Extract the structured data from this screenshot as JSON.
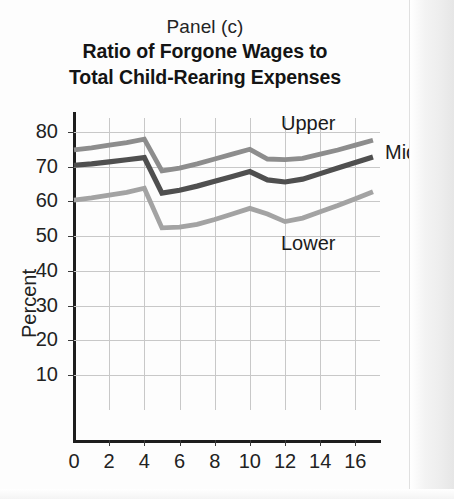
{
  "figure": {
    "panel_label": "Panel (c)",
    "title_line1": "Ratio of Forgone Wages to",
    "title_line2": "Total Child-Rearing Expenses"
  },
  "labels": {
    "upper": "Upper",
    "middle": "Middle",
    "lower": "Lower"
  },
  "colors": {
    "upper": "#8d8d8d",
    "middle": "#4f4f4f",
    "lower": "#a3a3a3",
    "grid": "#c8c8c8",
    "axis": "#1d1d1d",
    "background": "#fdfdfd"
  },
  "chart_data": {
    "type": "line",
    "title": "Ratio of Forgone Wages to Total Child-Rearing Expenses",
    "subtitle": "Panel (c)",
    "xlabel": "",
    "ylabel": "Percent",
    "xlim": [
      0,
      17.4
    ],
    "ylim": [
      0,
      84
    ],
    "xticks": [
      0,
      2,
      4,
      6,
      8,
      10,
      12,
      14,
      16
    ],
    "xtick_labels": [
      "0",
      "2",
      "4",
      "6",
      "8",
      "10",
      "12",
      "14",
      "16"
    ],
    "yticks": [
      10,
      20,
      30,
      40,
      50,
      60,
      70,
      80
    ],
    "ytick_labels": [
      "10",
      "20",
      "30",
      "40",
      "50",
      "60",
      "70",
      "80"
    ],
    "grid": true,
    "legend": "inline-annotations",
    "x": [
      0,
      1,
      2,
      3,
      4,
      5,
      6,
      7,
      8,
      9,
      10,
      11,
      12,
      13,
      14,
      15,
      16,
      17
    ],
    "series": [
      {
        "name": "Upper",
        "color": "#8d8d8d",
        "values": [
          74.8,
          75.4,
          76.2,
          76.9,
          77.9,
          68.8,
          69.6,
          70.8,
          72.2,
          73.6,
          75.0,
          72.2,
          72.0,
          72.4,
          73.6,
          74.8,
          76.2,
          77.6
        ]
      },
      {
        "name": "Middle",
        "color": "#4f4f4f",
        "values": [
          70.4,
          70.8,
          71.4,
          72.0,
          72.6,
          62.4,
          63.2,
          64.4,
          65.8,
          67.2,
          68.6,
          66.2,
          65.6,
          66.4,
          68.0,
          69.6,
          71.2,
          72.8
        ]
      },
      {
        "name": "Lower",
        "color": "#a3a3a3",
        "values": [
          60.4,
          61.0,
          61.8,
          62.6,
          63.8,
          52.4,
          52.6,
          53.4,
          54.8,
          56.4,
          58.0,
          56.4,
          54.2,
          55.2,
          57.0,
          58.8,
          60.8,
          62.8
        ]
      }
    ]
  }
}
